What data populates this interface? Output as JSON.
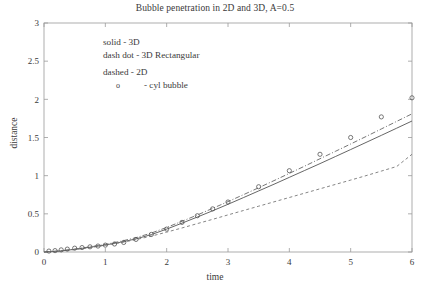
{
  "chart_data": {
    "type": "line",
    "title": "Bubble penetration in 2D and 3D, A=0.5",
    "xlabel": "time",
    "ylabel": "distance",
    "xlim": [
      0,
      6
    ],
    "ylim": [
      0,
      3
    ],
    "xticks": [
      "0",
      "1",
      "2",
      "3",
      "4",
      "5",
      "6"
    ],
    "xtick_values": [
      0,
      1,
      2,
      3,
      4,
      5,
      6
    ],
    "yticks": [
      "0",
      "0.5",
      "1",
      "1.5",
      "2",
      "2.5",
      "3"
    ],
    "ytick_values": [
      0,
      0.5,
      1,
      1.5,
      2,
      2.5,
      3
    ],
    "grid": false,
    "legend_position": "upper-left-inside",
    "legend": [
      "solid  - 3D",
      "dash dot - 3D Rectangular",
      "dashed - 2D"
    ],
    "legend_marker_symbol": "o",
    "legend_marker_text": "- cyl bubble",
    "series": [
      {
        "name": "3D",
        "style": "solid",
        "color": "#555555",
        "x": [
          0,
          0.25,
          0.5,
          0.75,
          1.0,
          1.25,
          1.5,
          1.75,
          2.0,
          2.25,
          2.5,
          2.75,
          3.0,
          3.25,
          3.5,
          3.75,
          4.0,
          4.25,
          4.5,
          4.75,
          5.0,
          5.25,
          5.5,
          5.75,
          6.0
        ],
        "values": [
          0.0,
          0.012,
          0.035,
          0.062,
          0.092,
          0.128,
          0.172,
          0.228,
          0.3,
          0.378,
          0.458,
          0.54,
          0.625,
          0.712,
          0.8,
          0.888,
          0.978,
          1.068,
          1.158,
          1.25,
          1.342,
          1.435,
          1.528,
          1.622,
          1.716
        ]
      },
      {
        "name": "3D Rectangular",
        "style": "dash-dot",
        "color": "#666666",
        "x": [
          0,
          0.25,
          0.5,
          0.75,
          1.0,
          1.25,
          1.5,
          1.75,
          2.0,
          2.25,
          2.5,
          2.75,
          3.0,
          3.25,
          3.5,
          3.75,
          4.0,
          4.25,
          4.5,
          4.75,
          5.0,
          5.25,
          5.5,
          5.75,
          6.0
        ],
        "values": [
          0.0,
          0.013,
          0.038,
          0.068,
          0.1,
          0.14,
          0.188,
          0.248,
          0.322,
          0.402,
          0.485,
          0.572,
          0.66,
          0.75,
          0.842,
          0.935,
          1.03,
          1.125,
          1.222,
          1.318,
          1.415,
          1.513,
          1.612,
          1.711,
          1.81
        ]
      },
      {
        "name": "2D",
        "style": "dashed",
        "color": "#777777",
        "x": [
          0,
          0.25,
          0.5,
          0.75,
          1.0,
          1.25,
          1.5,
          1.75,
          2.0,
          2.25,
          2.5,
          2.75,
          3.0,
          3.25,
          3.5,
          3.75,
          4.0,
          4.25,
          4.5,
          4.75,
          5.0,
          5.25,
          5.5,
          5.75,
          6.0
        ],
        "values": [
          0.0,
          0.011,
          0.032,
          0.058,
          0.088,
          0.122,
          0.162,
          0.208,
          0.26,
          0.315,
          0.372,
          0.428,
          0.486,
          0.543,
          0.6,
          0.657,
          0.714,
          0.771,
          0.828,
          0.885,
          0.942,
          1.0,
          1.06,
          1.12,
          1.28
        ]
      }
    ],
    "markers": {
      "name": "cyl bubble",
      "symbol": "o",
      "color": "#555555",
      "x": [
        0.08,
        0.18,
        0.28,
        0.38,
        0.5,
        0.62,
        0.75,
        0.88,
        1.0,
        1.15,
        1.3,
        1.5,
        1.75,
        2.0,
        2.25,
        2.5,
        2.75,
        3.0,
        3.5,
        4.0,
        4.5,
        5.0,
        5.5,
        6.0
      ],
      "values": [
        0.012,
        0.018,
        0.028,
        0.038,
        0.05,
        0.058,
        0.068,
        0.078,
        0.09,
        0.105,
        0.125,
        0.165,
        0.23,
        0.3,
        0.388,
        0.475,
        0.565,
        0.655,
        0.855,
        1.065,
        1.28,
        1.5,
        1.77,
        2.02
      ]
    }
  }
}
